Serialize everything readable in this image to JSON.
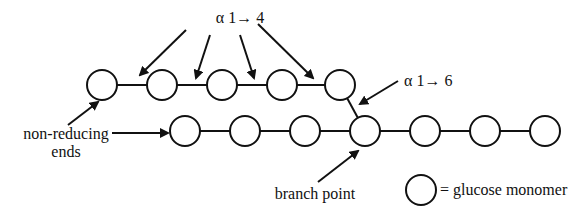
{
  "colors": {
    "background": "#ffffff",
    "stroke": "#111111",
    "node_fill": "#ffffff"
  },
  "labels": {
    "alpha14": "α 1→ 4",
    "alpha16": "α 1→ 6",
    "non_reducing_line1": "non-reducing",
    "non_reducing_line2": "ends",
    "branch_point": "branch point",
    "legend": "= glucose monomer"
  },
  "node_radius": 15,
  "top_chain": {
    "y": 85,
    "nodes_x": [
      102,
      162,
      222,
      282,
      340
    ]
  },
  "main_chain": {
    "y": 131,
    "nodes_x": [
      185,
      245,
      305,
      365,
      425,
      485,
      545
    ],
    "branch_index": 3
  },
  "legend_node": {
    "x": 421,
    "y": 190
  },
  "arrows": [
    {
      "name": "alpha14-arrow-1",
      "from": [
        186,
        30
      ],
      "to": [
        140,
        75
      ]
    },
    {
      "name": "alpha14-arrow-2",
      "from": [
        210,
        35
      ],
      "to": [
        196,
        78
      ]
    },
    {
      "name": "alpha14-arrow-3",
      "from": [
        240,
        35
      ],
      "to": [
        254,
        78
      ]
    },
    {
      "name": "alpha14-arrow-4",
      "from": [
        258,
        24
      ],
      "to": [
        313,
        78
      ]
    },
    {
      "name": "alpha16-arrow",
      "from": [
        398,
        81
      ],
      "to": [
        360,
        104
      ]
    },
    {
      "name": "non-reducing-arrow-top",
      "from": [
        68,
        125
      ],
      "to": [
        98,
        102
      ]
    },
    {
      "name": "non-reducing-arrow-main",
      "from": [
        112,
        133
      ],
      "to": [
        168,
        133
      ]
    },
    {
      "name": "branch-point-arrow",
      "from": [
        318,
        182
      ],
      "to": [
        358,
        151
      ]
    }
  ]
}
